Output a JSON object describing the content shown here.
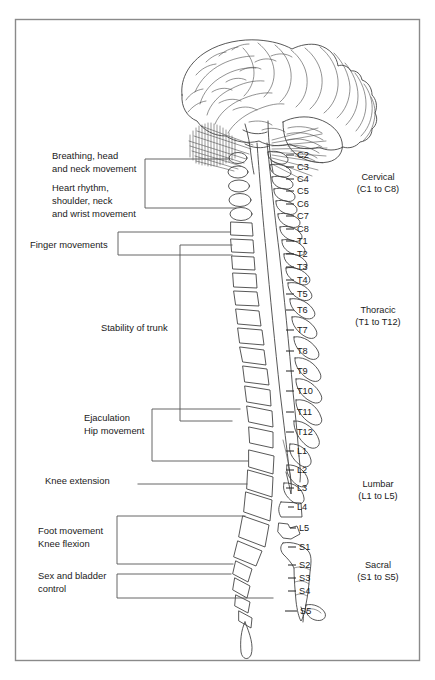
{
  "figure": {
    "border_color": "#8a8a8a",
    "line_color": "#555555",
    "anatomy_color": "#3a3a3a",
    "background": "#ffffff"
  },
  "vertebral_levels": [
    {
      "id": "C2",
      "label": "C2",
      "y": 158
    },
    {
      "id": "C3",
      "label": "C3",
      "y": 170
    },
    {
      "id": "C4",
      "label": "C4",
      "y": 182
    },
    {
      "id": "C5",
      "label": "C5",
      "y": 194
    },
    {
      "id": "C6",
      "label": "C6",
      "y": 207
    },
    {
      "id": "C7",
      "label": "C7",
      "y": 219
    },
    {
      "id": "C8",
      "label": "C8",
      "y": 232
    },
    {
      "id": "T1",
      "label": "T1",
      "y": 244
    },
    {
      "id": "T2",
      "label": "T2",
      "y": 257
    },
    {
      "id": "T3",
      "label": "T3",
      "y": 270
    },
    {
      "id": "T4",
      "label": "T4",
      "y": 283
    },
    {
      "id": "T5",
      "label": "T5",
      "y": 297
    },
    {
      "id": "T6",
      "label": "T6",
      "y": 313
    },
    {
      "id": "T7",
      "label": "T7",
      "y": 333
    },
    {
      "id": "T8",
      "label": "T8",
      "y": 354
    },
    {
      "id": "T9",
      "label": "T9",
      "y": 374
    },
    {
      "id": "T10",
      "label": "T10",
      "y": 394
    },
    {
      "id": "T11",
      "label": "T11",
      "y": 415
    },
    {
      "id": "T12",
      "label": "T12",
      "y": 435
    },
    {
      "id": "L1",
      "label": "L1",
      "y": 454
    },
    {
      "id": "L2",
      "label": "L2",
      "y": 473
    },
    {
      "id": "L3",
      "label": "L3",
      "y": 491
    },
    {
      "id": "L4",
      "label": "L4",
      "y": 510
    },
    {
      "id": "L5",
      "label": "L5",
      "y": 531
    },
    {
      "id": "S1",
      "label": "S1",
      "y": 550
    },
    {
      "id": "S2",
      "label": "S2",
      "y": 568
    },
    {
      "id": "S3",
      "label": "S3",
      "y": 581
    },
    {
      "id": "S4",
      "label": "S4",
      "y": 594
    },
    {
      "id": "S5",
      "label": "S5",
      "y": 614
    }
  ],
  "regions": [
    {
      "id": "cervical",
      "name": "Cervical",
      "range": "(C1 to C8)",
      "x": 378,
      "y": 180
    },
    {
      "id": "thoracic",
      "name": "Thoracic",
      "range": "(T1 to T12)",
      "x": 378,
      "y": 313
    },
    {
      "id": "lumbar",
      "name": "Lumbar",
      "range": "(L1 to L5)",
      "x": 378,
      "y": 487
    },
    {
      "id": "sacral",
      "name": "Sacral",
      "range": "(S1 to S5)",
      "x": 378,
      "y": 568
    }
  ],
  "function_labels": [
    {
      "id": "breathing",
      "lines": [
        "Breathing, head",
        "and neck movement"
      ],
      "x": 52,
      "y": 159
    },
    {
      "id": "heart-rhythm",
      "lines": [
        "Heart rhythm,",
        "shoulder, neck",
        "and wrist movement"
      ],
      "x": 52,
      "y": 191
    },
    {
      "id": "finger-movements",
      "lines": [
        "Finger movements"
      ],
      "x": 30,
      "y": 248
    },
    {
      "id": "stability-of-trunk",
      "lines": [
        "Stability of trunk"
      ],
      "x": 101,
      "y": 331
    },
    {
      "id": "ejaculation-hip",
      "lines": [
        "Ejaculation",
        "Hip movement"
      ],
      "x": 84,
      "y": 421
    },
    {
      "id": "knee-extension",
      "lines": [
        "Knee extension"
      ],
      "x": 45,
      "y": 484
    },
    {
      "id": "foot-movement",
      "lines": [
        "Foot movement",
        "Knee flexion"
      ],
      "x": 38,
      "y": 534
    },
    {
      "id": "sex-bladder",
      "lines": [
        "Sex and bladder",
        "control"
      ],
      "x": 38,
      "y": 579
    }
  ]
}
